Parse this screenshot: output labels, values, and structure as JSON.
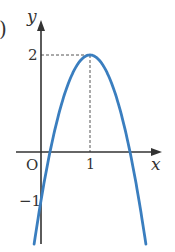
{
  "figure": {
    "paren_label": ")",
    "axis_labels": {
      "x": "x",
      "y": "y",
      "origin": "O"
    },
    "tick_labels": {
      "x_one": "1",
      "y_two": "2",
      "y_neg_one": "−1"
    },
    "colors": {
      "curve": "#3a7ebf",
      "axes": "#333333",
      "guide": "#555555"
    }
  },
  "chart_data": {
    "type": "line",
    "title": "",
    "xlabel": "x",
    "ylabel": "y",
    "function": "y = -3(x-1)^2 + 2",
    "vertex": [
      1,
      2
    ],
    "y_intercept": -1,
    "x_intercepts": [
      0.184,
      1.816
    ],
    "annotations": [
      "dashed guide from (0,2) to (1,2)",
      "dashed guide from (1,2) to (1,0)"
    ],
    "tick_labels_x": [
      "1"
    ],
    "tick_labels_y": [
      "2",
      "-1"
    ],
    "grid": false,
    "legend": null
  }
}
